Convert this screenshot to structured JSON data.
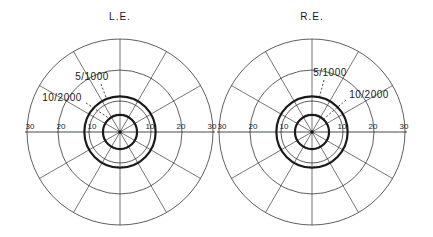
{
  "diagram": {
    "type": "visual field perimetry chart",
    "ink_color": "#1a1a1a",
    "background": "#ffffff",
    "ring_values_deg": [
      10,
      20,
      30
    ],
    "spoke_interval_deg": 30,
    "eyes": [
      {
        "id": "left",
        "title": "L.E.",
        "tick_labels_left": [
          "30",
          "20",
          "10"
        ],
        "tick_labels_right": [
          "10",
          "20",
          "30"
        ],
        "isopters": [
          {
            "label": "5/1000",
            "radius_deg": 11.5
          },
          {
            "label": "10/2000",
            "radius_deg": 5.5
          }
        ]
      },
      {
        "id": "right",
        "title": "R.E.",
        "tick_labels_left": [
          "30",
          "20",
          "10"
        ],
        "tick_labels_right": [
          "10",
          "20",
          "30"
        ],
        "isopters": [
          {
            "label": "5/1000",
            "radius_deg": 11.5
          },
          {
            "label": "10/2000",
            "radius_deg": 5.5
          }
        ]
      }
    ]
  }
}
